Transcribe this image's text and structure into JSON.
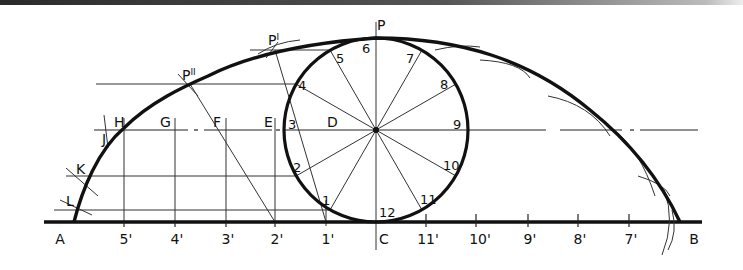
{
  "diagram": {
    "title": "",
    "type": "cycloid construction",
    "colors": {
      "ink": "#111111",
      "background": "#ffffff"
    },
    "circle": {
      "center": [
        376,
        130
      ],
      "radius": 92
    },
    "baseline": {
      "y": 222,
      "x_start": 44,
      "x_end": 702
    },
    "circle_points": [
      {
        "label": "1",
        "x": 330,
        "y": 210,
        "lx": 322,
        "ly": 205
      },
      {
        "label": "2",
        "x": 296,
        "y": 176,
        "lx": 293,
        "ly": 172
      },
      {
        "label": "3",
        "x": 284,
        "y": 130,
        "lx": 288,
        "ly": 129
      },
      {
        "label": "4",
        "x": 296,
        "y": 84,
        "lx": 298,
        "ly": 90
      },
      {
        "label": "5",
        "x": 330,
        "y": 50,
        "lx": 335,
        "ly": 61
      },
      {
        "label": "6",
        "x": 376,
        "y": 38,
        "lx": 362,
        "ly": 53
      },
      {
        "label": "7",
        "x": 422,
        "y": 50,
        "lx": 406,
        "ly": 63
      },
      {
        "label": "8",
        "x": 456,
        "y": 84,
        "lx": 441,
        "ly": 89
      },
      {
        "label": "9",
        "x": 468,
        "y": 130,
        "lx": 453,
        "ly": 129
      },
      {
        "label": "10",
        "x": 456,
        "y": 176,
        "lx": 443,
        "ly": 170
      },
      {
        "label": "11",
        "x": 422,
        "y": 210,
        "lx": 420,
        "ly": 204
      },
      {
        "label": "12",
        "x": 376,
        "y": 222,
        "lx": 380,
        "ly": 217
      }
    ],
    "baseline_ticks": [
      {
        "label": "A",
        "x": 60,
        "tick": false
      },
      {
        "label": "5'",
        "x": 124,
        "tick": true
      },
      {
        "label": "4'",
        "x": 175,
        "tick": true
      },
      {
        "label": "3'",
        "x": 226,
        "tick": true
      },
      {
        "label": "2'",
        "x": 275,
        "tick": true
      },
      {
        "label": "1'",
        "x": 326,
        "tick": true
      },
      {
        "label": "C",
        "x": 382,
        "tick": false
      },
      {
        "label": "11'",
        "x": 426,
        "tick": true
      },
      {
        "label": "10'",
        "x": 476,
        "tick": true
      },
      {
        "label": "9'",
        "x": 528,
        "tick": true
      },
      {
        "label": "8'",
        "x": 578,
        "tick": true
      },
      {
        "label": "7'",
        "x": 629,
        "tick": true
      },
      {
        "label": "B",
        "x": 692,
        "tick": false
      }
    ],
    "center_line_labels": [
      {
        "label": "H",
        "x": 114,
        "y": 127
      },
      {
        "label": "G",
        "x": 160,
        "y": 127
      },
      {
        "label": "F",
        "x": 213,
        "y": 127
      },
      {
        "label": "E",
        "x": 264,
        "y": 127
      },
      {
        "label": "D",
        "x": 327,
        "y": 127
      }
    ],
    "curve_point_labels": [
      {
        "label": "P",
        "x": 376,
        "y": 30,
        "sup": ""
      },
      {
        "label": "P",
        "x": 268,
        "y": 45,
        "sup": "I"
      },
      {
        "label": "P",
        "x": 183,
        "y": 80,
        "sup": "II"
      },
      {
        "label": "J",
        "x": 102,
        "y": 144,
        "sup": ""
      },
      {
        "label": "K",
        "x": 76,
        "y": 174,
        "sup": ""
      },
      {
        "label": "L",
        "x": 68,
        "y": 206,
        "sup": ""
      }
    ]
  }
}
